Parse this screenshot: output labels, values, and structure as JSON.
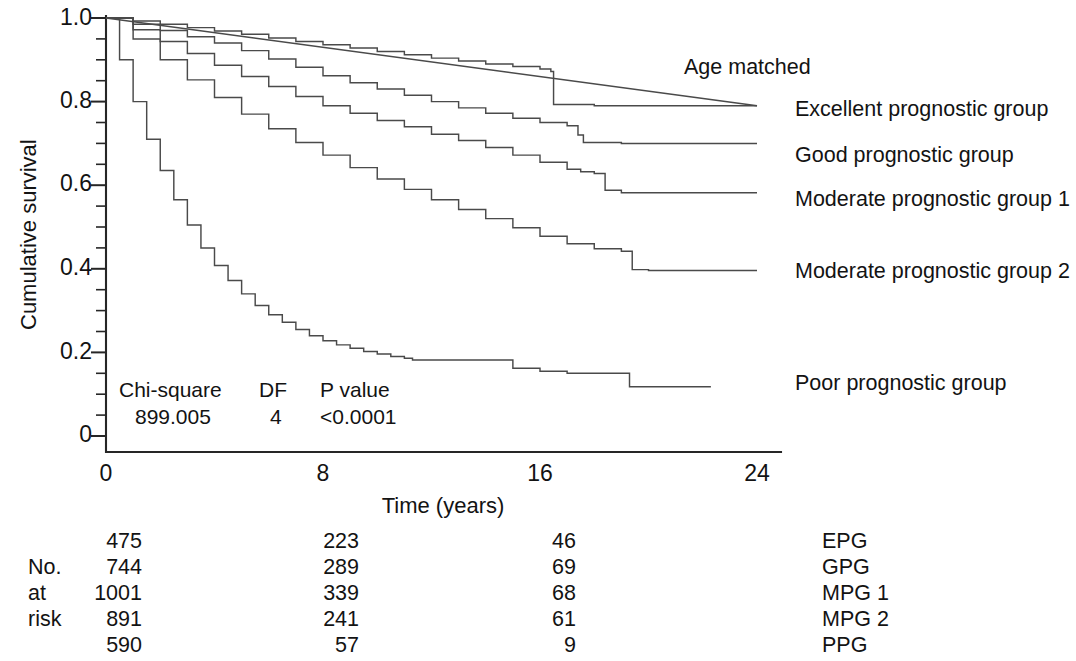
{
  "chart_data": {
    "type": "line",
    "title": "",
    "xlabel": "Time (years)",
    "ylabel": "Cumulative survival",
    "xlim": [
      0,
      24
    ],
    "ylim": [
      0,
      1.0
    ],
    "xticks": [
      "0",
      "8",
      "16",
      "24"
    ],
    "xtick_values": [
      0,
      8,
      16,
      24
    ],
    "yticks": [
      "0",
      "0.2",
      "0.4",
      "0.6",
      "0.8",
      "1.0"
    ],
    "ytick_values": [
      0,
      0.2,
      0.4,
      0.6,
      0.8,
      1.0
    ],
    "minor_ticks_y": true,
    "grid": false,
    "legend_position": "right-inline",
    "step_style": "kaplan-meier-step",
    "series": [
      {
        "name": "Age matched",
        "style": "straight",
        "label": "Age matched",
        "label_x": 24.5,
        "label_y": 0.885,
        "x": [
          0,
          24
        ],
        "y": [
          1.0,
          0.79
        ]
      },
      {
        "name": "Excellent prognostic group",
        "style": "step",
        "label": "Excellent prognostic group",
        "label_x": 24.5,
        "label_y": 0.78,
        "x": [
          0,
          1.0,
          2.0,
          3.0,
          4.0,
          5.0,
          6.0,
          7.0,
          8.0,
          9.0,
          10.0,
          11.0,
          12.0,
          13.0,
          14.0,
          15.0,
          16.0,
          16.4,
          16.5,
          18.0,
          20.0,
          22.0,
          24.0
        ],
        "y": [
          1.0,
          0.993,
          0.985,
          0.977,
          0.969,
          0.961,
          0.952,
          0.944,
          0.936,
          0.928,
          0.92,
          0.912,
          0.904,
          0.897,
          0.89,
          0.884,
          0.878,
          0.872,
          0.793,
          0.79,
          0.79,
          0.79,
          0.79
        ]
      },
      {
        "name": "Good prognostic group",
        "style": "step",
        "label": "Good prognostic group",
        "label_x": 24.5,
        "label_y": 0.675,
        "x": [
          0,
          1.0,
          2.0,
          3.0,
          4.0,
          5.0,
          6.0,
          7.0,
          8.0,
          9.0,
          10.0,
          11.0,
          12.0,
          13.0,
          14.0,
          15.0,
          16.0,
          17.0,
          17.4,
          17.6,
          19.0,
          21.0,
          23.0,
          24.0
        ],
        "y": [
          1.0,
          0.985,
          0.97,
          0.955,
          0.94,
          0.922,
          0.902,
          0.882,
          0.862,
          0.845,
          0.83,
          0.815,
          0.8,
          0.785,
          0.772,
          0.76,
          0.75,
          0.742,
          0.72,
          0.702,
          0.7,
          0.7,
          0.7,
          0.7
        ]
      },
      {
        "name": "Moderate prognostic group 1",
        "style": "step",
        "label": "Moderate prognostic group 1",
        "label_x": 24.5,
        "label_y": 0.565,
        "x": [
          0,
          1.0,
          2.0,
          3.0,
          4.0,
          5.0,
          6.0,
          7.0,
          8.0,
          9.0,
          10.0,
          11.0,
          12.0,
          13.0,
          14.0,
          15.0,
          16.0,
          17.0,
          17.5,
          18.0,
          18.4,
          19.0,
          21.0,
          23.0,
          24.0
        ],
        "y": [
          1.0,
          0.972,
          0.944,
          0.915,
          0.887,
          0.86,
          0.836,
          0.812,
          0.79,
          0.772,
          0.755,
          0.74,
          0.722,
          0.707,
          0.69,
          0.672,
          0.655,
          0.638,
          0.632,
          0.628,
          0.588,
          0.582,
          0.582,
          0.582,
          0.582
        ]
      },
      {
        "name": "Moderate prognostic group 2",
        "style": "step",
        "label": "Moderate prognostic group 2",
        "label_x": 24.5,
        "label_y": 0.395,
        "x": [
          0,
          1.0,
          2.0,
          3.0,
          4.0,
          5.0,
          6.0,
          7.0,
          8.0,
          9.0,
          10.0,
          11.0,
          12.0,
          13.0,
          14.0,
          15.0,
          16.0,
          17.0,
          18.0,
          19.0,
          19.4,
          20.0,
          22.0,
          24.0
        ],
        "y": [
          1.0,
          0.95,
          0.9,
          0.852,
          0.81,
          0.77,
          0.735,
          0.702,
          0.672,
          0.642,
          0.615,
          0.59,
          0.565,
          0.542,
          0.52,
          0.498,
          0.478,
          0.46,
          0.448,
          0.442,
          0.398,
          0.396,
          0.396,
          0.396
        ]
      },
      {
        "name": "Poor prognostic group",
        "style": "step",
        "label": "Poor prognostic group",
        "label_x": 24.5,
        "label_y": 0.165,
        "x": [
          0,
          0.5,
          1.0,
          1.5,
          2.0,
          2.5,
          3.0,
          3.5,
          4.0,
          4.5,
          5.0,
          5.5,
          6.0,
          6.5,
          7.0,
          7.5,
          8.0,
          8.5,
          9.0,
          9.5,
          10.0,
          10.5,
          11.0,
          11.3,
          12.0,
          13.0,
          14.0,
          14.7,
          15.0,
          16.0,
          17.0,
          18.0,
          19.1,
          19.3,
          21.0,
          22.3
        ],
        "y": [
          1.0,
          0.9,
          0.8,
          0.71,
          0.635,
          0.565,
          0.505,
          0.45,
          0.408,
          0.372,
          0.34,
          0.312,
          0.29,
          0.272,
          0.255,
          0.24,
          0.228,
          0.218,
          0.21,
          0.202,
          0.196,
          0.19,
          0.186,
          0.182,
          0.182,
          0.182,
          0.182,
          0.182,
          0.162,
          0.155,
          0.15,
          0.15,
          0.15,
          0.118,
          0.118,
          0.118
        ]
      }
    ],
    "annotations": {
      "stats": {
        "headers": [
          "Chi-square",
          "DF",
          "P value"
        ],
        "values": [
          "899.005",
          "4",
          "<0.0001"
        ]
      }
    },
    "risk_table": {
      "side_label_lines": [
        "",
        "No.",
        "at",
        "risk",
        ""
      ],
      "time_points": [
        0,
        8,
        16
      ],
      "rows": [
        {
          "tag": "EPG",
          "counts": [
            "475",
            "223",
            "46"
          ]
        },
        {
          "tag": "GPG",
          "counts": [
            "744",
            "289",
            "69"
          ]
        },
        {
          "tag": "MPG 1",
          "counts": [
            "1001",
            "339",
            "68"
          ]
        },
        {
          "tag": "MPG 2",
          "counts": [
            "891",
            "241",
            "61"
          ]
        },
        {
          "tag": "PPG",
          "counts": [
            "590",
            "57",
            "9"
          ]
        }
      ]
    },
    "colors": {
      "curve": "#4a4a4a",
      "axis": "#262626",
      "text": "#131313",
      "background": "#ffffff"
    }
  }
}
